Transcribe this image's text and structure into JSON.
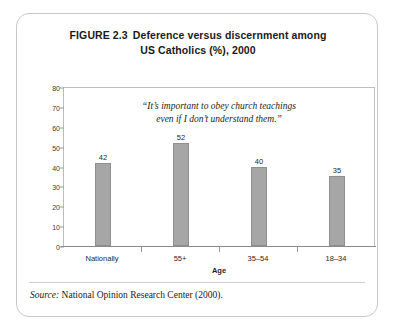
{
  "figure": {
    "title_label": "FIGURE 2.3",
    "title_line1": "Deference versus discernment among",
    "title_line2": "US Catholics (%), 2000",
    "source_label": "Source:",
    "source_text": "National Opinion Research Center (2000)."
  },
  "chart_data": {
    "type": "bar",
    "categories": [
      "Nationally",
      "55+",
      "35–54",
      "18–34"
    ],
    "values": [
      42,
      52,
      40,
      35
    ],
    "xlabel": "Age",
    "ylabel": "",
    "ylim": [
      0,
      80
    ],
    "yticks": [
      0,
      10,
      20,
      30,
      40,
      50,
      60,
      70,
      80
    ],
    "ytick_labels": [
      "0",
      "10",
      "20",
      "30",
      "40",
      "50",
      "60",
      "70",
      "80"
    ],
    "grid": false,
    "legend": "none",
    "bar_color": "#a6a6a6",
    "annotation_line1": "“It’s important to obey church teachings",
    "annotation_line2": "even if I don’t understand them.”"
  }
}
